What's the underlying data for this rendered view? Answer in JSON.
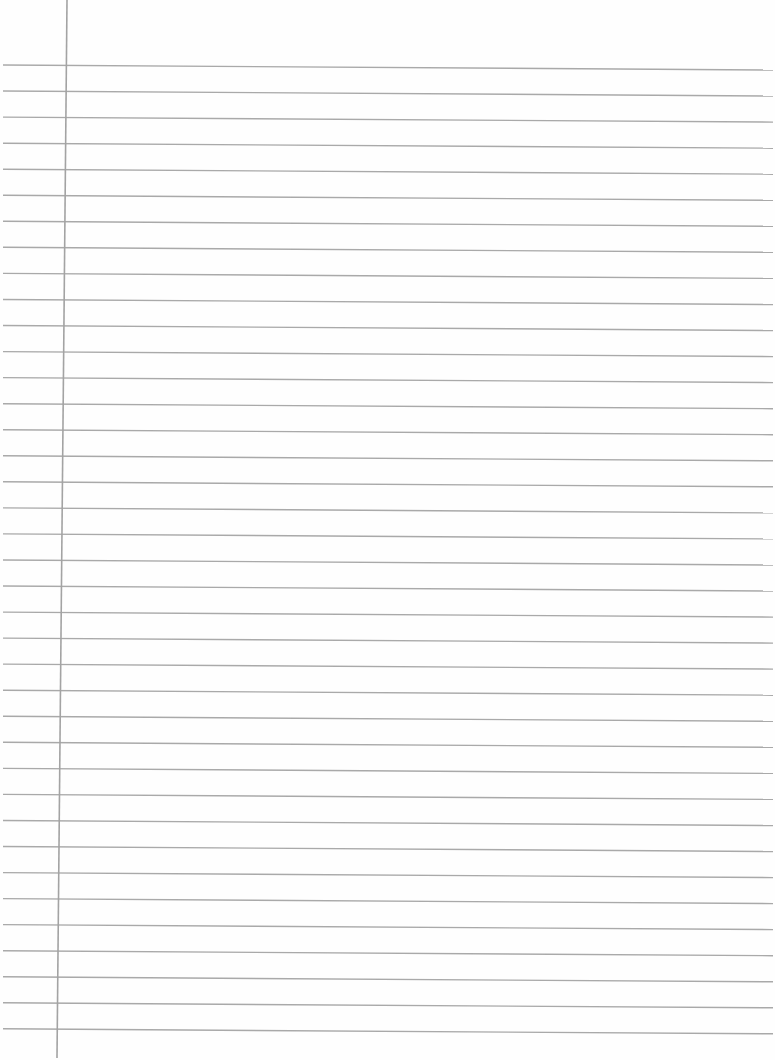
{
  "page": {
    "type": "lined-paper",
    "background_color": "#fefefe",
    "line_color": "#a9a9a9",
    "margin_line_color": "#a3a3a3"
  },
  "rules": {
    "count": 38,
    "first_y_left": 65,
    "first_y_right": 70,
    "spacing": 26.05,
    "x_start": 3,
    "x_end": 773
  },
  "margin_line": {
    "x_top": 67,
    "y_top": 0,
    "x_bottom": 57,
    "y_bottom": 1058
  }
}
